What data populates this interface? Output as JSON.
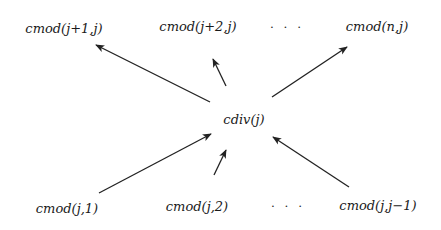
{
  "diagram": {
    "type": "dependency-graph",
    "center": {
      "id": "cdiv",
      "label": "cdiv(j)"
    },
    "top_row": [
      {
        "id": "cmod_j1",
        "label": "cmod(j+1,j)"
      },
      {
        "id": "cmod_j2",
        "label": "cmod(j+2,j)"
      },
      {
        "id": "dots_top",
        "label": "· · ·"
      },
      {
        "id": "cmod_nj",
        "label": "cmod(n,j)"
      }
    ],
    "bottom_row": [
      {
        "id": "cmod_j_1",
        "label": "cmod(j,1)"
      },
      {
        "id": "cmod_j_2",
        "label": "cmod(j,2)"
      },
      {
        "id": "dots_bottom",
        "label": "· · ·"
      },
      {
        "id": "cmod_j_jm1",
        "label": "cmod(j,j−1)"
      }
    ],
    "edges": [
      {
        "from": "cdiv",
        "to": "cmod_j1"
      },
      {
        "from": "cdiv",
        "to": "cmod_j2"
      },
      {
        "from": "cdiv",
        "to": "cmod_nj"
      },
      {
        "from": "cmod_j_1",
        "to": "cdiv"
      },
      {
        "from": "cmod_j_2",
        "to": "cdiv"
      },
      {
        "from": "cmod_j_jm1",
        "to": "cdiv"
      }
    ],
    "colors": {
      "line": "#222222",
      "text": "#1a1a1a",
      "background": "#ffffff"
    }
  }
}
